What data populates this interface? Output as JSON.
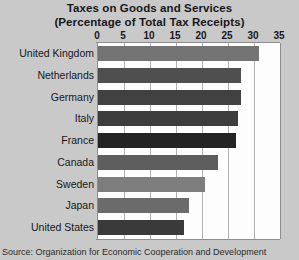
{
  "chart_data": {
    "type": "bar",
    "orientation": "horizontal",
    "title": "Taxes on Goods and Services",
    "subtitle": "(Percentage of Total Tax Receipts)",
    "xlabel": "",
    "ylabel": "",
    "xlim": [
      0,
      35
    ],
    "xticks": [
      0,
      5,
      10,
      15,
      20,
      25,
      30,
      35
    ],
    "grid": true,
    "legend": "none",
    "categories": [
      "United Kingdom",
      "Netherlands",
      "Germany",
      "Italy",
      "France",
      "Canada",
      "Sweden",
      "Japan",
      "United States"
    ],
    "values": [
      31,
      27.5,
      27.5,
      27,
      26.5,
      23,
      20.5,
      17.5,
      16.5
    ],
    "bar_colors": [
      "#737373",
      "#4f4f4f",
      "#414141",
      "#3d3d3d",
      "#242424",
      "#5e5e5e",
      "#7d7d7d",
      "#6b6b6b",
      "#3a3a3a"
    ],
    "source": "Source: Organization for Economic Cooperation and Development",
    "background_color": "#c9c9c9",
    "plot_background_color": "#fdfdfd"
  }
}
